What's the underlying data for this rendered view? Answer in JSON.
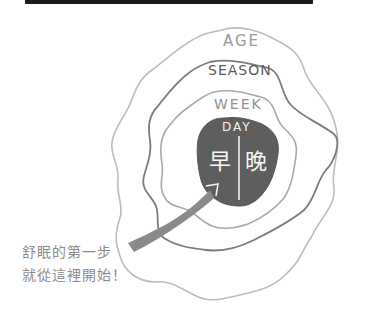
{
  "diagram": {
    "rings": [
      {
        "id": "age",
        "label": "AGE",
        "stroke": "#b8b8b8"
      },
      {
        "id": "season",
        "label": "SEASON",
        "stroke": "#7a7a7a"
      },
      {
        "id": "week",
        "label": "WEEK",
        "stroke": "#aaaaaa"
      },
      {
        "id": "day",
        "label": "DAY",
        "fill": "#5e5e5e"
      }
    ],
    "day_split": {
      "left": "早",
      "right": "晚"
    },
    "arrow_color": "#8a8a8a",
    "caption": {
      "line1": "舒眠的第一步",
      "line2": "就從這裡開始！"
    }
  }
}
